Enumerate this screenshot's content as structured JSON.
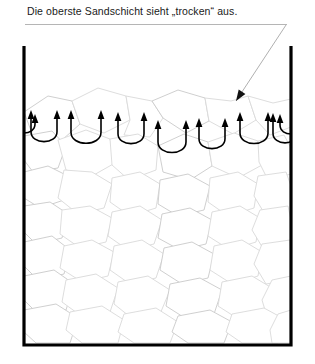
{
  "figure": {
    "caption": "Die oberste Sandschicht sieht „trocken“ aus.",
    "language": "de"
  },
  "annotation": {
    "underline": {
      "x1": 25,
      "y1": 24.5,
      "x2": 287,
      "y2": 24.5
    },
    "leader_line": {
      "x1": 286,
      "y1": 25,
      "x2": 236,
      "y2": 101
    },
    "pointer_target_label": "top sand layer surface"
  },
  "container": {
    "name": "open-top-vessel",
    "left_wall_x": 24,
    "right_wall_x": 291,
    "top_y": 46,
    "bottom_y": 345,
    "stroke_width": 3.2
  },
  "colors": {
    "ink": "#000000",
    "caption_text": "#1a1a1a",
    "underline": "#b5b5b5",
    "leader_line": "#b0b0b0",
    "grain_stroke": "#d9d9d9",
    "grain_stroke_dark": "#c9c9c9",
    "grain_fill": "#ffffff",
    "background": "#ffffff"
  },
  "sand": {
    "surface_y": 92,
    "fill_bottom_y": 343,
    "grain_stroke_width": 0.9,
    "grains": [
      [
        [
          24,
          112
        ],
        [
          48,
          96
        ],
        [
          72,
          101
        ],
        [
          80,
          124
        ],
        [
          62,
          140
        ],
        [
          33,
          136
        ]
      ],
      [
        [
          72,
          101
        ],
        [
          98,
          88
        ],
        [
          126,
          96
        ],
        [
          130,
          120
        ],
        [
          104,
          133
        ],
        [
          80,
          124
        ]
      ],
      [
        [
          126,
          96
        ],
        [
          152,
          101
        ],
        [
          163,
          118
        ],
        [
          150,
          137
        ],
        [
          124,
          135
        ],
        [
          130,
          120
        ]
      ],
      [
        [
          152,
          101
        ],
        [
          178,
          90
        ],
        [
          205,
          98
        ],
        [
          209,
          121
        ],
        [
          186,
          133
        ],
        [
          163,
          118
        ]
      ],
      [
        [
          205,
          98
        ],
        [
          231,
          101
        ],
        [
          248,
          96
        ],
        [
          256,
          120
        ],
        [
          233,
          134
        ],
        [
          209,
          121
        ]
      ],
      [
        [
          248,
          96
        ],
        [
          273,
          103
        ],
        [
          291,
          99
        ],
        [
          291,
          127
        ],
        [
          270,
          135
        ],
        [
          256,
          120
        ]
      ],
      [
        [
          24,
          136
        ],
        [
          52,
          131
        ],
        [
          66,
          146
        ],
        [
          58,
          168
        ],
        [
          33,
          172
        ],
        [
          24,
          160
        ]
      ],
      [
        [
          58,
          140
        ],
        [
          86,
          130
        ],
        [
          110,
          139
        ],
        [
          115,
          163
        ],
        [
          92,
          176
        ],
        [
          66,
          170
        ]
      ],
      [
        [
          110,
          139
        ],
        [
          138,
          134
        ],
        [
          158,
          146
        ],
        [
          156,
          170
        ],
        [
          129,
          180
        ],
        [
          112,
          165
        ]
      ],
      [
        [
          158,
          146
        ],
        [
          184,
          134
        ],
        [
          208,
          142
        ],
        [
          212,
          166
        ],
        [
          190,
          180
        ],
        [
          163,
          172
        ]
      ],
      [
        [
          208,
          142
        ],
        [
          234,
          133
        ],
        [
          258,
          141
        ],
        [
          262,
          165
        ],
        [
          238,
          178
        ],
        [
          212,
          166
        ]
      ],
      [
        [
          258,
          141
        ],
        [
          284,
          135
        ],
        [
          291,
          148
        ],
        [
          291,
          174
        ],
        [
          268,
          180
        ],
        [
          259,
          162
        ]
      ],
      [
        [
          24,
          172
        ],
        [
          48,
          166
        ],
        [
          68,
          176
        ],
        [
          64,
          200
        ],
        [
          40,
          208
        ],
        [
          24,
          198
        ]
      ],
      [
        [
          64,
          170
        ],
        [
          92,
          172
        ],
        [
          112,
          184
        ],
        [
          104,
          208
        ],
        [
          78,
          214
        ],
        [
          58,
          198
        ]
      ],
      [
        [
          112,
          178
        ],
        [
          140,
          172
        ],
        [
          160,
          184
        ],
        [
          156,
          208
        ],
        [
          130,
          216
        ],
        [
          110,
          202
        ]
      ],
      [
        [
          160,
          180
        ],
        [
          188,
          174
        ],
        [
          210,
          186
        ],
        [
          204,
          210
        ],
        [
          178,
          216
        ],
        [
          158,
          204
        ]
      ],
      [
        [
          210,
          178
        ],
        [
          238,
          172
        ],
        [
          258,
          184
        ],
        [
          254,
          208
        ],
        [
          228,
          216
        ],
        [
          208,
          202
        ]
      ],
      [
        [
          258,
          176
        ],
        [
          286,
          172
        ],
        [
          291,
          186
        ],
        [
          291,
          212
        ],
        [
          266,
          216
        ],
        [
          254,
          196
        ]
      ],
      [
        [
          24,
          206
        ],
        [
          50,
          202
        ],
        [
          68,
          214
        ],
        [
          62,
          238
        ],
        [
          36,
          244
        ],
        [
          24,
          232
        ]
      ],
      [
        [
          62,
          210
        ],
        [
          90,
          206
        ],
        [
          112,
          218
        ],
        [
          106,
          242
        ],
        [
          80,
          248
        ],
        [
          60,
          234
        ]
      ],
      [
        [
          112,
          212
        ],
        [
          140,
          206
        ],
        [
          162,
          220
        ],
        [
          154,
          244
        ],
        [
          128,
          250
        ],
        [
          108,
          236
        ]
      ],
      [
        [
          162,
          214
        ],
        [
          190,
          208
        ],
        [
          212,
          220
        ],
        [
          206,
          244
        ],
        [
          180,
          250
        ],
        [
          158,
          238
        ]
      ],
      [
        [
          212,
          212
        ],
        [
          240,
          206
        ],
        [
          260,
          218
        ],
        [
          256,
          242
        ],
        [
          230,
          250
        ],
        [
          208,
          236
        ]
      ],
      [
        [
          260,
          210
        ],
        [
          288,
          206
        ],
        [
          291,
          220
        ],
        [
          291,
          246
        ],
        [
          264,
          250
        ],
        [
          252,
          230
        ]
      ],
      [
        [
          24,
          242
        ],
        [
          52,
          236
        ],
        [
          70,
          250
        ],
        [
          64,
          274
        ],
        [
          38,
          280
        ],
        [
          24,
          266
        ]
      ],
      [
        [
          64,
          246
        ],
        [
          92,
          240
        ],
        [
          114,
          252
        ],
        [
          108,
          276
        ],
        [
          82,
          282
        ],
        [
          60,
          268
        ]
      ],
      [
        [
          114,
          246
        ],
        [
          142,
          240
        ],
        [
          164,
          254
        ],
        [
          156,
          278
        ],
        [
          130,
          284
        ],
        [
          110,
          270
        ]
      ],
      [
        [
          164,
          248
        ],
        [
          192,
          242
        ],
        [
          214,
          254
        ],
        [
          208,
          278
        ],
        [
          182,
          284
        ],
        [
          160,
          270
        ]
      ],
      [
        [
          214,
          246
        ],
        [
          242,
          240
        ],
        [
          262,
          252
        ],
        [
          258,
          276
        ],
        [
          232,
          284
        ],
        [
          210,
          270
        ]
      ],
      [
        [
          262,
          244
        ],
        [
          290,
          240
        ],
        [
          291,
          254
        ],
        [
          291,
          280
        ],
        [
          266,
          284
        ],
        [
          254,
          264
        ]
      ],
      [
        [
          24,
          276
        ],
        [
          54,
          270
        ],
        [
          74,
          284
        ],
        [
          66,
          310
        ],
        [
          40,
          316
        ],
        [
          24,
          300
        ]
      ],
      [
        [
          66,
          280
        ],
        [
          96,
          274
        ],
        [
          118,
          288
        ],
        [
          110,
          312
        ],
        [
          84,
          318
        ],
        [
          62,
          302
        ]
      ],
      [
        [
          118,
          282
        ],
        [
          148,
          276
        ],
        [
          170,
          290
        ],
        [
          160,
          314
        ],
        [
          134,
          320
        ],
        [
          114,
          304
        ]
      ],
      [
        [
          170,
          284
        ],
        [
          200,
          278
        ],
        [
          222,
          290
        ],
        [
          214,
          314
        ],
        [
          188,
          320
        ],
        [
          166,
          306
        ]
      ],
      [
        [
          222,
          282
        ],
        [
          252,
          276
        ],
        [
          272,
          288
        ],
        [
          266,
          312
        ],
        [
          240,
          320
        ],
        [
          218,
          306
        ]
      ],
      [
        [
          272,
          280
        ],
        [
          291,
          276
        ],
        [
          291,
          292
        ],
        [
          291,
          316
        ],
        [
          268,
          320
        ],
        [
          262,
          300
        ]
      ],
      [
        [
          24,
          310
        ],
        [
          56,
          304
        ],
        [
          78,
          318
        ],
        [
          70,
          343
        ],
        [
          36,
          343
        ],
        [
          24,
          332
        ]
      ],
      [
        [
          70,
          312
        ],
        [
          102,
          306
        ],
        [
          124,
          320
        ],
        [
          118,
          343
        ],
        [
          82,
          343
        ],
        [
          66,
          330
        ]
      ],
      [
        [
          124,
          314
        ],
        [
          156,
          308
        ],
        [
          178,
          322
        ],
        [
          170,
          343
        ],
        [
          134,
          343
        ],
        [
          118,
          332
        ]
      ],
      [
        [
          178,
          316
        ],
        [
          210,
          310
        ],
        [
          232,
          322
        ],
        [
          224,
          343
        ],
        [
          188,
          343
        ],
        [
          172,
          332
        ]
      ],
      [
        [
          232,
          314
        ],
        [
          264,
          308
        ],
        [
          286,
          320
        ],
        [
          278,
          343
        ],
        [
          242,
          343
        ],
        [
          226,
          332
        ]
      ],
      [
        [
          278,
          314
        ],
        [
          291,
          310
        ],
        [
          291,
          343
        ],
        [
          272,
          343
        ],
        [
          270,
          330
        ]
      ]
    ]
  },
  "menisci": {
    "description": "U-shaped capillary menisci with upward arrowheads at both tips along the sand surface",
    "count": 9,
    "stroke_width": 1.6,
    "items": [
      {
        "name": "meniscus-left-edge",
        "cx": 24,
        "top_y": 114,
        "bottom_y": 132,
        "half_width": 11,
        "clipped": "left"
      },
      {
        "name": "meniscus-1",
        "cx": 44,
        "top_y": 110,
        "bottom_y": 141,
        "half_width": 13,
        "clipped": "none"
      },
      {
        "name": "meniscus-2",
        "cx": 86,
        "top_y": 110,
        "bottom_y": 143,
        "half_width": 15,
        "clipped": "none"
      },
      {
        "name": "meniscus-3",
        "cx": 131,
        "top_y": 112,
        "bottom_y": 143,
        "half_width": 13,
        "clipped": "none"
      },
      {
        "name": "meniscus-4",
        "cx": 172,
        "top_y": 120,
        "bottom_y": 152,
        "half_width": 14,
        "clipped": "none"
      },
      {
        "name": "meniscus-5",
        "cx": 212,
        "top_y": 118,
        "bottom_y": 148,
        "half_width": 13,
        "clipped": "none"
      },
      {
        "name": "meniscus-6",
        "cx": 254,
        "top_y": 112,
        "bottom_y": 143,
        "half_width": 14,
        "clipped": "none"
      },
      {
        "name": "meniscus-7",
        "cx": 285,
        "top_y": 113,
        "bottom_y": 142,
        "half_width": 12,
        "clipped": "none"
      },
      {
        "name": "meniscus-right-edge",
        "cx": 291,
        "top_y": 114,
        "bottom_y": 133,
        "half_width": 11,
        "clipped": "right"
      }
    ]
  }
}
